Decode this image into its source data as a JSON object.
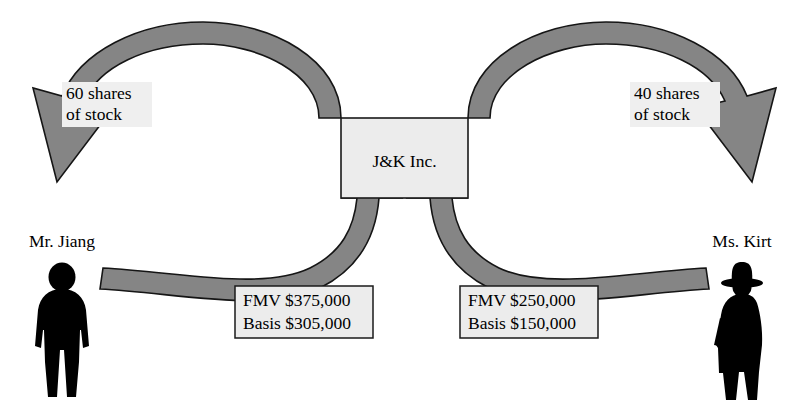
{
  "diagram": {
    "entity": {
      "name": "J&K Inc."
    },
    "people": [
      {
        "id": "jiang",
        "name": "Mr. Jiang",
        "icon": "male-silhouette-icon"
      },
      {
        "id": "kirt",
        "name": "Ms. Kirt",
        "icon": "female-silhouette-icon"
      }
    ],
    "stock_labels": [
      {
        "id": "jiang-stock",
        "line1": "60 shares",
        "line2": "of stock"
      },
      {
        "id": "kirt-stock",
        "line1": "40 shares",
        "line2": "of stock"
      }
    ],
    "property_callouts": [
      {
        "id": "jiang-property",
        "line1": "FMV $375,000",
        "line2": "Basis $305,000"
      },
      {
        "id": "kirt-property",
        "line1": "FMV $250,000",
        "line2": "Basis $150,000"
      }
    ],
    "flows": [
      {
        "id": "stock-to-jiang",
        "from": "J&K Inc.",
        "to": "Mr. Jiang",
        "label": "60 shares of stock"
      },
      {
        "id": "stock-to-kirt",
        "from": "J&K Inc.",
        "to": "Ms. Kirt",
        "label": "40 shares of stock"
      },
      {
        "id": "property-from-jiang",
        "from": "Mr. Jiang",
        "to": "J&K Inc.",
        "label": "FMV $375,000 Basis $305,000"
      },
      {
        "id": "property-from-kirt",
        "from": "Ms. Kirt",
        "to": "J&K Inc.",
        "label": "FMV $250,000 Basis $150,000"
      }
    ],
    "colors": {
      "band_fill": "#858585",
      "band_stroke": "#151515",
      "box_fill": "#ececec",
      "box_stroke": "#1a1a1a",
      "silhouette": "#000000",
      "background": "#ffffff"
    }
  }
}
